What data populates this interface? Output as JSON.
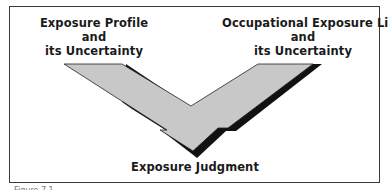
{
  "diagram": {
    "left_input": {
      "lines": [
        "Exposure Profile",
        "and",
        "its Uncertainty"
      ]
    },
    "right_input": {
      "lines": [
        "Occupational Exposure Limit",
        "and",
        "its Uncertainty"
      ]
    },
    "output": {
      "label": "Exposure Judgment"
    },
    "colors": {
      "arrow_fill": "#c8c8c8",
      "arrow_shadow": "#111111",
      "border": "#3a3a3a"
    }
  },
  "caption": {
    "text": "Figure 7.1 ..."
  }
}
